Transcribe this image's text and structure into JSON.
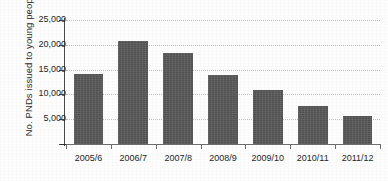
{
  "chart_data": {
    "type": "bar",
    "title": "",
    "xlabel": "",
    "ylabel": "No. PNDs issued to young people",
    "categories": [
      "2005/6",
      "2006/7",
      "2007/8",
      "2008/9",
      "2009/10",
      "2010/11",
      "2011/12"
    ],
    "values": [
      14100,
      20800,
      18300,
      14000,
      10800,
      7700,
      5700
    ],
    "ylim": [
      0,
      25000
    ],
    "ytick_values": [
      0,
      5000,
      10000,
      15000,
      20000,
      25000
    ],
    "ytick_labels": [
      "–",
      "5,000",
      "10,000",
      "15,000",
      "20,000",
      "25,000"
    ],
    "grid": "horizontal-dotted",
    "legend": "none",
    "bar_color": "#595959",
    "gridline_color": "#bfbfbf",
    "axis_color": "#4a4a4a",
    "background_color": "#fdfdfd"
  }
}
